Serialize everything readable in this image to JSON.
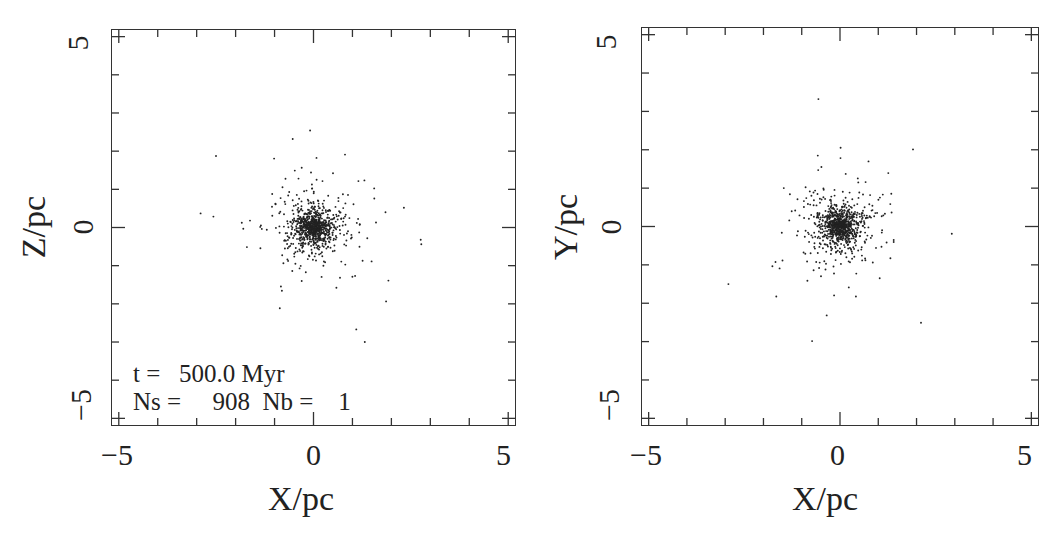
{
  "chart_data": [
    {
      "type": "scatter",
      "title": "",
      "xlabel": "X/pc",
      "ylabel": "Z/pc",
      "xlim": [
        -5.2,
        5.2
      ],
      "ylim": [
        -5.2,
        5.2
      ],
      "xticks": [
        "-5",
        "0",
        "5"
      ],
      "yticks": [
        "-5",
        "0",
        "5"
      ],
      "grid": false,
      "legend": null,
      "annotations": [
        "t =   500.0 Myr",
        "Ns =     908  Nb =    1"
      ],
      "series": [
        {
          "name": "stars",
          "n_points": 909,
          "distribution": "centrally concentrated cluster at (0,0), core radius ~0.3 pc, halo to ~5 pc",
          "color": "#222222"
        }
      ]
    },
    {
      "type": "scatter",
      "title": "",
      "xlabel": "X/pc",
      "ylabel": "Y/pc",
      "xlim": [
        -5.2,
        5.2
      ],
      "ylim": [
        -5.2,
        5.2
      ],
      "xticks": [
        "-5",
        "0",
        "5"
      ],
      "yticks": [
        "-5",
        "0",
        "5"
      ],
      "grid": false,
      "legend": null,
      "annotations": [],
      "series": [
        {
          "name": "stars",
          "n_points": 909,
          "distribution": "centrally concentrated cluster at (0,0), core radius ~0.3 pc, halo to ~5 pc",
          "color": "#222222"
        }
      ]
    }
  ],
  "left": {
    "xlabel": "X/pc",
    "ylabel": "Z/pc",
    "xticks": [
      "−5",
      "0",
      "5"
    ],
    "yticks": [
      "−5",
      "0",
      "5"
    ],
    "annot_time": "t =   500.0 Myr",
    "annot_counts": "Ns =     908  Nb =    1",
    "seed": 12345
  },
  "right": {
    "xlabel": "X/pc",
    "ylabel": "Y/pc",
    "xticks": [
      "−5",
      "0",
      "5"
    ],
    "yticks": [
      "−5",
      "0",
      "5"
    ],
    "seed": 98765
  },
  "style": {
    "point_color": "#222222",
    "frame_color": "#333333"
  }
}
